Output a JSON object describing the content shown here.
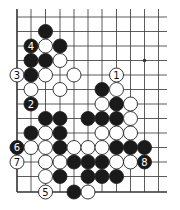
{
  "diagram": {
    "type": "go-board-fragment",
    "colors": {
      "background": "#ffffff",
      "line": "#333333",
      "black_stone": "#1a1a1a",
      "white_stone": "#ffffff",
      "stone_outline": "#222222"
    },
    "grid": {
      "col_x": [
        17,
        31,
        45.5,
        60,
        74,
        88,
        102,
        116.5,
        130.5,
        144.5,
        158.5
      ],
      "row_y": [
        17,
        31.5,
        46,
        60.5,
        75,
        89.5,
        104,
        118.5,
        133,
        147.5,
        162,
        176.5,
        192
      ],
      "right_extend_to": 167,
      "top_extend_to": 9,
      "left_edge": true,
      "bottom_edge": true,
      "stone_radius": 7
    },
    "star_points": [
      {
        "c": 9,
        "r": 3
      }
    ],
    "stones": [
      {
        "c": 2,
        "r": 1,
        "color": "black",
        "label": ""
      },
      {
        "c": 1,
        "r": 2,
        "color": "black",
        "label": "4"
      },
      {
        "c": 2,
        "r": 2,
        "color": "white",
        "label": ""
      },
      {
        "c": 3,
        "r": 2,
        "color": "black",
        "label": ""
      },
      {
        "c": 1,
        "r": 3,
        "color": "black",
        "label": ""
      },
      {
        "c": 2,
        "r": 3,
        "color": "black",
        "label": ""
      },
      {
        "c": 3,
        "r": 3,
        "color": "white",
        "label": ""
      },
      {
        "c": 0,
        "r": 4,
        "color": "white",
        "label": "3"
      },
      {
        "c": 1,
        "r": 4,
        "color": "black",
        "label": ""
      },
      {
        "c": 2,
        "r": 4,
        "color": "white",
        "label": ""
      },
      {
        "c": 4,
        "r": 4,
        "color": "white",
        "label": ""
      },
      {
        "c": 7,
        "r": 4,
        "color": "white",
        "label": "1"
      },
      {
        "c": 1,
        "r": 5,
        "color": "white",
        "label": ""
      },
      {
        "c": 3,
        "r": 5,
        "color": "white",
        "label": ""
      },
      {
        "c": 6,
        "r": 5,
        "color": "black",
        "label": ""
      },
      {
        "c": 7,
        "r": 5,
        "color": "white",
        "label": ""
      },
      {
        "c": 1,
        "r": 6,
        "color": "black",
        "label": "2"
      },
      {
        "c": 6,
        "r": 6,
        "color": "white",
        "label": ""
      },
      {
        "c": 7,
        "r": 6,
        "color": "black",
        "label": ""
      },
      {
        "c": 8,
        "r": 6,
        "color": "white",
        "label": ""
      },
      {
        "c": 2,
        "r": 7,
        "color": "black",
        "label": ""
      },
      {
        "c": 3,
        "r": 7,
        "color": "black",
        "label": ""
      },
      {
        "c": 5,
        "r": 7,
        "color": "black",
        "label": ""
      },
      {
        "c": 6,
        "r": 7,
        "color": "black",
        "label": ""
      },
      {
        "c": 7,
        "r": 7,
        "color": "black",
        "label": ""
      },
      {
        "c": 8,
        "r": 7,
        "color": "white",
        "label": ""
      },
      {
        "c": 1,
        "r": 8,
        "color": "black",
        "label": ""
      },
      {
        "c": 2,
        "r": 8,
        "color": "white",
        "label": ""
      },
      {
        "c": 3,
        "r": 8,
        "color": "black",
        "label": ""
      },
      {
        "c": 6,
        "r": 8,
        "color": "white",
        "label": ""
      },
      {
        "c": 7,
        "r": 8,
        "color": "white",
        "label": ""
      },
      {
        "c": 8,
        "r": 8,
        "color": "white",
        "label": ""
      },
      {
        "c": 0,
        "r": 9,
        "color": "black",
        "label": "6"
      },
      {
        "c": 1,
        "r": 9,
        "color": "white",
        "label": ""
      },
      {
        "c": 2,
        "r": 9,
        "color": "white",
        "label": ""
      },
      {
        "c": 3,
        "r": 9,
        "color": "black",
        "label": ""
      },
      {
        "c": 4,
        "r": 9,
        "color": "white",
        "label": ""
      },
      {
        "c": 5,
        "r": 9,
        "color": "white",
        "label": ""
      },
      {
        "c": 6,
        "r": 9,
        "color": "white",
        "label": ""
      },
      {
        "c": 7,
        "r": 9,
        "color": "black",
        "label": ""
      },
      {
        "c": 8,
        "r": 9,
        "color": "black",
        "label": ""
      },
      {
        "c": 9,
        "r": 9,
        "color": "black",
        "label": ""
      },
      {
        "c": 0,
        "r": 10,
        "color": "white",
        "label": "7"
      },
      {
        "c": 2,
        "r": 10,
        "color": "white",
        "label": ""
      },
      {
        "c": 3,
        "r": 10,
        "color": "white",
        "label": ""
      },
      {
        "c": 4,
        "r": 10,
        "color": "black",
        "label": ""
      },
      {
        "c": 5,
        "r": 10,
        "color": "black",
        "label": ""
      },
      {
        "c": 6,
        "r": 10,
        "color": "black",
        "label": ""
      },
      {
        "c": 7,
        "r": 10,
        "color": "white",
        "label": ""
      },
      {
        "c": 8,
        "r": 10,
        "color": "white",
        "label": ""
      },
      {
        "c": 9,
        "r": 10,
        "color": "black",
        "label": "8"
      },
      {
        "c": 2,
        "r": 11,
        "color": "white",
        "label": ""
      },
      {
        "c": 3,
        "r": 11,
        "color": "black",
        "label": ""
      },
      {
        "c": 5,
        "r": 11,
        "color": "black",
        "label": ""
      },
      {
        "c": 6,
        "r": 11,
        "color": "black",
        "label": ""
      },
      {
        "c": 7,
        "r": 11,
        "color": "black",
        "label": ""
      },
      {
        "c": 2,
        "r": 12,
        "color": "white",
        "label": "5"
      },
      {
        "c": 4,
        "r": 12,
        "color": "black",
        "label": ""
      },
      {
        "c": 5,
        "r": 12,
        "color": "white",
        "label": ""
      }
    ]
  }
}
